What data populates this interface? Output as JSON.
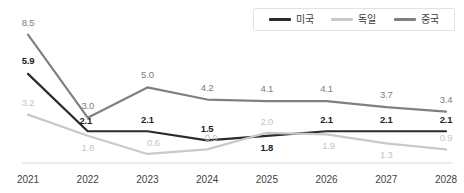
{
  "chart_data": {
    "type": "line",
    "title": "",
    "subtitle": "",
    "xlabel": "",
    "ylabel": "",
    "grid": false,
    "legend_position": "top-right",
    "categories": [
      "2021",
      "2022",
      "2023",
      "2024",
      "2025",
      "2026",
      "2027",
      "2028"
    ],
    "xlim": [
      2021,
      2028
    ],
    "ylim": [
      0,
      9
    ],
    "series": [
      {
        "name": "미국",
        "color": "#2b2b2b",
        "label_color": "#1f1f1f",
        "label_weight": "bold",
        "values": [
          5.9,
          2.1,
          2.1,
          1.5,
          1.8,
          2.1,
          2.1,
          2.1
        ],
        "labels": [
          "5.9",
          "2.1",
          "2.1",
          "1.5",
          "1.8",
          "2.1",
          "2.1",
          "2.1"
        ]
      },
      {
        "name": "독일",
        "color": "#c9c9c9",
        "label_color": "#c4c4c4",
        "label_weight": "normal",
        "values": [
          3.2,
          1.8,
          0.6,
          0.9,
          2.0,
          1.9,
          1.3,
          0.9
        ],
        "labels": [
          "3.2",
          "1.8",
          "0.6",
          "0.9",
          "2.0",
          "1.9",
          "1.3",
          "0.9"
        ]
      },
      {
        "name": "중국",
        "color": "#808080",
        "label_color": "#7d7d7d",
        "label_weight": "normal",
        "values": [
          8.5,
          3.0,
          5.0,
          4.2,
          4.1,
          4.1,
          3.7,
          3.4
        ],
        "labels": [
          "8.5",
          "3.0",
          "5.0",
          "4.2",
          "4.1",
          "4.1",
          "3.7",
          "3.4"
        ]
      }
    ],
    "label_offsets": {
      "미국": [
        {
          "dx": 0,
          "dy": -13
        },
        {
          "dx": -2,
          "dy": -10
        },
        {
          "dx": 0,
          "dy": -11
        },
        {
          "dx": 0,
          "dy": -11
        },
        {
          "dx": 0,
          "dy": 12
        },
        {
          "dx": 0,
          "dy": -11
        },
        {
          "dx": 0,
          "dy": -11
        },
        {
          "dx": 0,
          "dy": -11
        }
      ],
      "독일": [
        {
          "dx": 0,
          "dy": -12
        },
        {
          "dx": 0,
          "dy": 12
        },
        {
          "dx": 6,
          "dy": -11
        },
        {
          "dx": 4,
          "dy": -11
        },
        {
          "dx": 0,
          "dy": -11
        },
        {
          "dx": 2,
          "dy": 12
        },
        {
          "dx": 0,
          "dy": 12
        },
        {
          "dx": 0,
          "dy": -11
        }
      ],
      "중국": [
        {
          "dx": 0,
          "dy": -12
        },
        {
          "dx": 0,
          "dy": -12
        },
        {
          "dx": 0,
          "dy": -12
        },
        {
          "dx": 0,
          "dy": -12
        },
        {
          "dx": 0,
          "dy": -12
        },
        {
          "dx": 0,
          "dy": -12
        },
        {
          "dx": 0,
          "dy": -12
        },
        {
          "dx": 0,
          "dy": -12
        }
      ]
    }
  },
  "legend": {
    "items": [
      {
        "label": "미국",
        "color": "#2b2b2b",
        "key": "us"
      },
      {
        "label": "독일",
        "color": "#c9c9c9",
        "key": "de"
      },
      {
        "label": "중국",
        "color": "#808080",
        "key": "cn"
      }
    ]
  },
  "axis": {
    "baseline_color": "#d9d9d9"
  }
}
